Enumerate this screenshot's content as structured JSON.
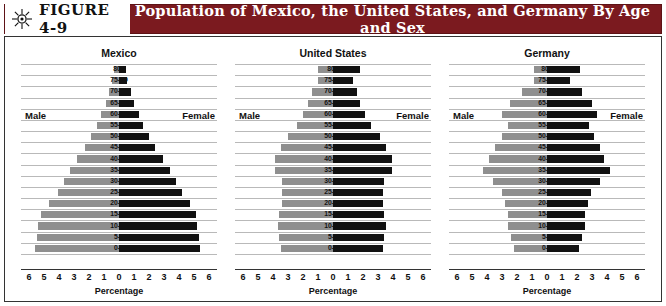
{
  "header": {
    "figure_number": "FIGURE 4-9",
    "title": "Population of Mexico, the United States, and Germany By Age and Sex",
    "icon": "sun-icon",
    "bar_color": "#7b1a1f"
  },
  "legend": {
    "male_label": "Male",
    "female_label": "Female",
    "male_color": "#8f8f8f",
    "female_color": "#111111"
  },
  "axis": {
    "xlabel": "Percentage",
    "ticks": [
      "6",
      "5",
      "4",
      "3",
      "2",
      "1",
      "0",
      "1",
      "2",
      "3",
      "4",
      "5",
      "6"
    ],
    "xlim": [
      -6,
      6
    ]
  },
  "chart_data": {
    "type": "bar",
    "title": "Population of Mexico, the United States, and Germany By Age and Sex",
    "xlabel": "Percentage",
    "ylabel": "",
    "xlim": [
      -6,
      6
    ],
    "grid": true,
    "legend_position": "inside-panel",
    "orientation": "horizontal-population-pyramid",
    "categories": [
      "0-4",
      "5-9",
      "10-14",
      "15-19",
      "20-24",
      "25-29",
      "30-34",
      "35-39",
      "40-44",
      "45-49",
      "50-54",
      "55-59",
      "60-64",
      "65-69",
      "70-74",
      "75-79",
      "80+"
    ],
    "panels": [
      {
        "name": "Mexico",
        "series": [
          {
            "name": "Male",
            "values": [
              5.6,
              5.5,
              5.4,
              5.2,
              4.7,
              4.1,
              3.7,
              3.3,
              2.8,
              2.3,
              1.9,
              1.5,
              1.2,
              0.9,
              0.7,
              0.45,
              0.35
            ]
          },
          {
            "name": "Female",
            "values": [
              5.4,
              5.3,
              5.2,
              5.1,
              4.7,
              4.2,
              3.8,
              3.4,
              2.9,
              2.4,
              2.0,
              1.6,
              1.3,
              1.0,
              0.8,
              0.5,
              0.45
            ]
          }
        ]
      },
      {
        "name": "United States",
        "series": [
          {
            "name": "Male",
            "values": [
              3.5,
              3.6,
              3.7,
              3.6,
              3.4,
              3.4,
              3.4,
              3.9,
              3.9,
              3.5,
              3.0,
              2.4,
              2.0,
              1.7,
              1.4,
              1.0,
              1.0
            ]
          },
          {
            "name": "Female",
            "values": [
              3.3,
              3.4,
              3.5,
              3.4,
              3.3,
              3.3,
              3.4,
              3.9,
              3.9,
              3.5,
              3.1,
              2.5,
              2.1,
              1.8,
              1.6,
              1.3,
              1.8
            ]
          }
        ]
      },
      {
        "name": "Germany",
        "series": [
          {
            "name": "Male",
            "values": [
              2.2,
              2.4,
              2.6,
              2.6,
              2.8,
              3.0,
              3.6,
              4.3,
              3.9,
              3.5,
              3.0,
              2.6,
              3.0,
              2.5,
              1.7,
              0.9,
              0.9
            ]
          },
          {
            "name": "Female",
            "values": [
              2.1,
              2.3,
              2.5,
              2.5,
              2.7,
              2.9,
              3.5,
              4.2,
              3.8,
              3.5,
              3.1,
              2.8,
              3.3,
              3.0,
              2.3,
              1.5,
              2.2
            ]
          }
        ]
      }
    ]
  }
}
